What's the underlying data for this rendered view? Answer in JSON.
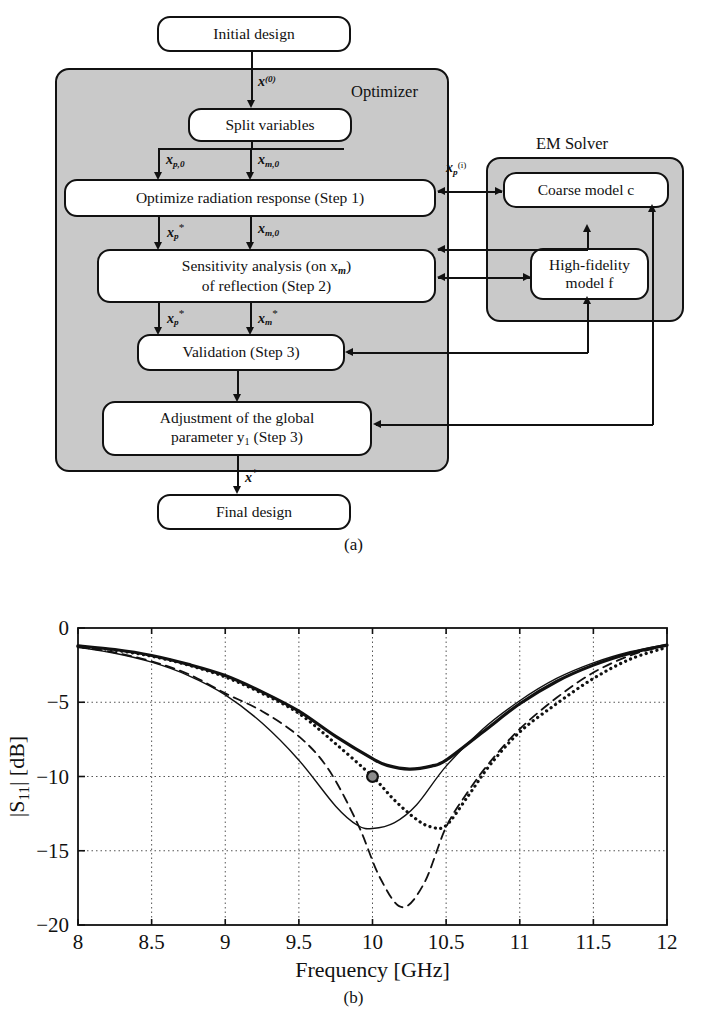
{
  "figure_a": {
    "caption": "(a)",
    "panels": [
      {
        "name": "optimizer",
        "label": "Optimizer"
      },
      {
        "name": "em-solver",
        "label": "EM Solver"
      }
    ],
    "nodes": {
      "initial_design": "Initial design",
      "split_variables": "Split variables",
      "optimize_radiation": "Optimize radiation response (Step 1)",
      "sensitivity_line1": "Sensitivity analysis (on x",
      "sensitivity_line1_sub": "m",
      "sensitivity_line1_end": ")",
      "sensitivity_line2": "of reflection  (Step 2)",
      "validation": "Validation (Step 3)",
      "adjustment_line1": "Adjustment of the global",
      "adjustment_line2a": "parameter y",
      "adjustment_line2_sub": "1",
      "adjustment_line2b": " (Step 3)",
      "final_design": "Final design",
      "coarse_model": "Coarse model c",
      "high_fidelity_line1": "High-fidelity",
      "high_fidelity_line2": "model f"
    },
    "edge_labels": {
      "x0": "x(0)",
      "xp0": "xp,0",
      "xm0_a": "xm,0",
      "xp_star_a": "xp*",
      "xm0_b": "xm,0",
      "xp_star_b": "xp*",
      "xm_star": "xm*",
      "xp_i": "xp(i)",
      "x_star": "x*"
    }
  },
  "figure_b": {
    "caption": "(b)"
  },
  "chart_data": {
    "type": "line",
    "title": "",
    "xlabel": "Frequency [GHz]",
    "ylabel": "|S11| [dB]",
    "ylabel_parts": {
      "base": "|S",
      "sub": "11",
      "rest": "| [dB]"
    },
    "xlim": [
      8,
      12
    ],
    "ylim": [
      -20,
      0
    ],
    "xticks": [
      "8",
      "8.5",
      "9",
      "9.5",
      "10",
      "10.5",
      "11",
      "11.5",
      "12"
    ],
    "xtick_values": [
      8,
      8.5,
      9,
      9.5,
      10,
      10.5,
      11,
      11.5,
      12
    ],
    "yticks": [
      "0",
      "-5",
      "-10",
      "-15",
      "-20"
    ],
    "ytick_values": [
      0,
      -5,
      -10,
      -15,
      -20
    ],
    "grid": "dotted",
    "legend": "none",
    "marker": {
      "name": "design-spec-marker",
      "x": 10,
      "y": -10,
      "fill": "#8c8c8c",
      "stroke": "#111"
    },
    "series": [
      {
        "name": "thick-solid",
        "style": "solid",
        "width": 3.2,
        "color": "#111111",
        "x": [
          8,
          8.25,
          8.5,
          8.75,
          9,
          9.25,
          9.5,
          9.75,
          10,
          10.1,
          10.25,
          10.4,
          10.5,
          10.75,
          11,
          11.25,
          11.5,
          11.75,
          12
        ],
        "y": [
          -1.2,
          -1.45,
          -1.85,
          -2.45,
          -3.2,
          -4.3,
          -5.6,
          -7.3,
          -8.8,
          -9.25,
          -9.5,
          -9.3,
          -8.9,
          -7.0,
          -5.1,
          -3.6,
          -2.5,
          -1.7,
          -1.15
        ]
      },
      {
        "name": "dotted",
        "style": "dotted",
        "width": 3.2,
        "color": "#111111",
        "x": [
          8,
          8.25,
          8.5,
          8.75,
          9,
          9.25,
          9.5,
          9.75,
          10,
          10.15,
          10.3,
          10.4,
          10.5,
          10.65,
          10.8,
          11,
          11.25,
          11.5,
          11.75,
          12
        ],
        "y": [
          -1.25,
          -1.5,
          -1.9,
          -2.5,
          -3.3,
          -4.4,
          -5.75,
          -7.8,
          -10.0,
          -11.6,
          -12.9,
          -13.4,
          -13.3,
          -11.3,
          -9.2,
          -7.0,
          -5.1,
          -3.4,
          -2.1,
          -1.3
        ]
      },
      {
        "name": "thin-solid",
        "style": "solid",
        "width": 1.4,
        "color": "#111111",
        "x": [
          8,
          8.25,
          8.5,
          8.75,
          9,
          9.25,
          9.5,
          9.75,
          9.9,
          10.0,
          10.15,
          10.3,
          10.5,
          10.75,
          11,
          11.25,
          11.5,
          11.75,
          12
        ],
        "y": [
          -1.3,
          -1.7,
          -2.3,
          -3.2,
          -4.5,
          -6.4,
          -8.9,
          -12.0,
          -13.3,
          -13.5,
          -13.1,
          -11.9,
          -9.3,
          -6.8,
          -4.9,
          -3.4,
          -2.35,
          -1.6,
          -1.1
        ]
      },
      {
        "name": "dashed",
        "style": "dashed",
        "width": 1.8,
        "color": "#111111",
        "x": [
          8,
          8.25,
          8.5,
          8.75,
          9,
          9.25,
          9.5,
          9.7,
          9.9,
          10.05,
          10.2,
          10.35,
          10.5,
          10.65,
          10.8,
          11,
          11.25,
          11.5,
          11.75,
          12
        ],
        "y": [
          -1.25,
          -1.65,
          -2.25,
          -3.1,
          -4.4,
          -5.6,
          -7.3,
          -9.5,
          -13.2,
          -16.8,
          -18.8,
          -17.2,
          -13.4,
          -11.0,
          -9.0,
          -6.8,
          -4.7,
          -3.0,
          -1.85,
          -1.15
        ]
      }
    ]
  }
}
